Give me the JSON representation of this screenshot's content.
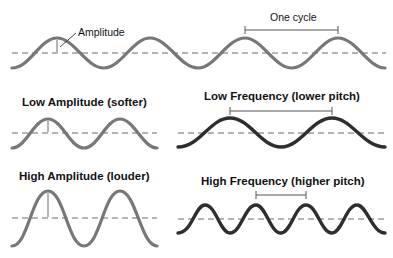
{
  "diagram": {
    "colors": {
      "gray_wave": "#777777",
      "dark_wave": "#2e2e2e",
      "dashed": "#6a6a6a",
      "bracket": "#555555"
    },
    "reference": {
      "amplitude_label": "Amplitude",
      "cycle_label": "One cycle"
    },
    "panels": [
      {
        "id": "low-amplitude",
        "title": "Low Amplitude (softer)"
      },
      {
        "id": "low-frequency",
        "title": "Low Frequency (lower pitch)"
      },
      {
        "id": "high-amplitude",
        "title": "High Amplitude (louder)"
      },
      {
        "id": "high-frequency",
        "title": "High Frequency (higher pitch)"
      }
    ]
  }
}
